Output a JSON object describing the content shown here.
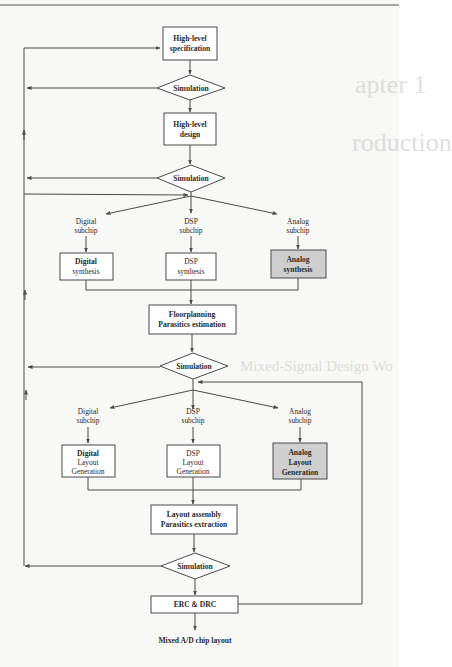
{
  "figure": {
    "type": "flowchart",
    "nodes": {
      "spec": {
        "line1": "High-level",
        "line2": "specification"
      },
      "sim1": {
        "label": "Simulation"
      },
      "design": {
        "line1": "High-level",
        "line2": "design"
      },
      "sim2": {
        "label": "Simulation"
      },
      "branch1": {
        "digital": {
          "line1": "Digital",
          "line2": "subchip"
        },
        "dsp": {
          "line1": "DSP",
          "line2": "subchip"
        },
        "analog": {
          "line1": "Analog",
          "line2": "subchip"
        }
      },
      "synthesis": {
        "digital": {
          "line1": "Digital",
          "line2": "synthesis"
        },
        "dsp": {
          "line1": "DSP",
          "line2": "synthesis"
        },
        "analog": {
          "line1": "Analog",
          "line2": "synthesis"
        }
      },
      "floorplan": {
        "line1": "Floorplanning",
        "line2": "Parasitics estimation"
      },
      "sim3": {
        "label": "Simulation"
      },
      "branch2": {
        "digital": {
          "line1": "Digital",
          "line2": "subchip"
        },
        "dsp": {
          "line1": "DSP",
          "line2": "subchip"
        },
        "analog": {
          "line1": "Analog",
          "line2": "subchip"
        }
      },
      "layoutgen": {
        "digital": {
          "line1": "Digital",
          "line2": "Layout",
          "line3": "Generation"
        },
        "dsp": {
          "line1": "DSP",
          "line2": "Layout",
          "line3": "Generation"
        },
        "analog": {
          "line1": "Analog",
          "line2": "Layout",
          "line3": "Generation"
        }
      },
      "assembly": {
        "line1": "Layout assembly",
        "line2": "Parasitics extraction"
      },
      "sim4": {
        "label": "Simulation"
      },
      "erc": {
        "label": "ERC & DRC"
      },
      "output": {
        "label": "Mixed A/D chip layout"
      }
    },
    "highlight_color": "#cfcfcf",
    "line_color": "#4a4a4a"
  },
  "background_bleed": {
    "line1": "apter 1",
    "line2": "roduction",
    "line3": "Mixed-Signal Design Wo"
  }
}
